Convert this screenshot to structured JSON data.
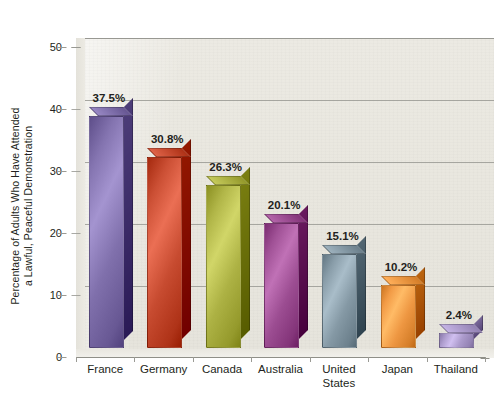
{
  "chart_data": {
    "type": "bar",
    "title": "",
    "xlabel": "",
    "ylabel_line1": "Percentage of Adults Who Have Attended",
    "ylabel_line2": "a Lawful, Peaceful Demonstration",
    "categories": [
      "France",
      "Germany",
      "Canada",
      "Australia",
      "United States",
      "Japan",
      "Thailand"
    ],
    "values": [
      37.5,
      30.8,
      26.3,
      20.1,
      15.1,
      10.2,
      2.4
    ],
    "data_labels": [
      "37.5%",
      "30.8%",
      "26.3%",
      "20.1%",
      "15.1%",
      "10.2%",
      "2.4%"
    ],
    "ylim": [
      0,
      50
    ],
    "yticks": [
      0,
      10,
      20,
      30,
      40,
      50
    ],
    "ytick_labels": [
      "0",
      "10",
      "20",
      "30",
      "40",
      "50"
    ],
    "grid": true,
    "legend": "none",
    "style": "3d-column",
    "colors": {
      "France": "#7a6aa6",
      "Germany": "#c1452a",
      "Canada": "#a7ac3e",
      "Australia": "#96478c",
      "United States": "#7f939f",
      "Japan": "#e8913c",
      "Thailand": "#a695c6",
      "plot_background": "#e9e7df",
      "gridline": "#9a9a94",
      "text": "#231f20",
      "page_background": "#ffffff"
    },
    "series": [
      {
        "name": "Percentage of adults who have attended a lawful, peaceful demonstration",
        "points": [
          {
            "category": "France",
            "value": 37.5,
            "label": "37.5%",
            "color": "#7a6aa6"
          },
          {
            "category": "Germany",
            "value": 30.8,
            "label": "30.8%",
            "color": "#c1452a"
          },
          {
            "category": "Canada",
            "value": 26.3,
            "label": "26.3%",
            "color": "#a7ac3e"
          },
          {
            "category": "Australia",
            "value": 20.1,
            "label": "20.1%",
            "color": "#96478c"
          },
          {
            "category": "United States",
            "value": 15.1,
            "label": "15.1%",
            "color": "#7f939f"
          },
          {
            "category": "Japan",
            "value": 10.2,
            "label": "10.2%",
            "color": "#e8913c"
          },
          {
            "category": "Thailand",
            "value": 2.4,
            "label": "2.4%",
            "color": "#a695c6"
          }
        ]
      }
    ]
  }
}
